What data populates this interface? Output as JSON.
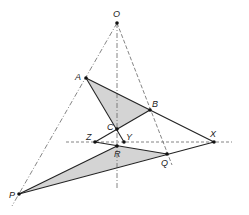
{
  "diagram": {
    "colors": {
      "line": "#222222",
      "guide": "#666666",
      "fill": "#d4d4d4",
      "point": "#111111"
    },
    "points": {
      "O": {
        "label": "O",
        "x": 117,
        "y": 23
      },
      "A": {
        "label": "A",
        "x": 86,
        "y": 78
      },
      "B": {
        "label": "B",
        "x": 150,
        "y": 110
      },
      "C": {
        "label": "C",
        "x": 117,
        "y": 129
      },
      "Z": {
        "label": "Z",
        "x": 95,
        "y": 142
      },
      "Y": {
        "label": "Y",
        "x": 124,
        "y": 142
      },
      "R": {
        "label": "R",
        "x": 117,
        "y": 146
      },
      "Q": {
        "label": "Q",
        "x": 167,
        "y": 154
      },
      "X": {
        "label": "X",
        "x": 214,
        "y": 142
      },
      "P": {
        "label": "P",
        "x": 19,
        "y": 194
      }
    },
    "triangles": [
      {
        "name": "ABC",
        "vertices": [
          "A",
          "B",
          "C"
        ],
        "shaded": true
      },
      {
        "name": "PQR",
        "vertices": [
          "P",
          "Q",
          "R"
        ],
        "shaded": true
      }
    ],
    "perspective_lines": [
      "OP",
      "OR",
      "OQ"
    ],
    "axis_line": "ZYX"
  }
}
